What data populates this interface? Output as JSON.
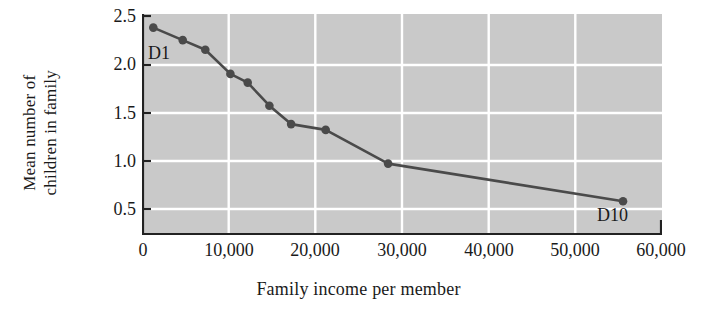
{
  "chart_data": {
    "type": "line",
    "title": "",
    "xlabel": "Family income per member",
    "ylabel": "Mean number of children in family",
    "ylabel_lines": [
      "Mean number of",
      "children in family"
    ],
    "xlim": [
      0,
      60000
    ],
    "ylim": [
      0,
      2.5
    ],
    "xticks": [
      0,
      10000,
      20000,
      30000,
      40000,
      50000,
      60000
    ],
    "xticklabels": [
      "0",
      "10,000",
      "20,000",
      "30,000",
      "40,000",
      "50,000",
      "60,000"
    ],
    "yticks": [
      0.5,
      1.0,
      1.5,
      2.0,
      2.5
    ],
    "yticklabels": [
      "0.5",
      "1.0",
      "1.5",
      "2.0",
      "2.5"
    ],
    "grid": true,
    "grid_color": "#ffffff",
    "plot_background": "#c9c9c9",
    "line_color": "#4a4a4a",
    "marker_color": "#4a4a4a",
    "legend": "none",
    "x": [
      1300,
      4700,
      7300,
      10200,
      12200,
      14700,
      17200,
      21200,
      28400,
      55500
    ],
    "values": [
      2.38,
      2.25,
      2.15,
      1.9,
      1.81,
      1.57,
      1.38,
      1.32,
      0.97,
      0.58
    ],
    "point_labels": [
      {
        "name": "D1",
        "index": 0,
        "text": "D1"
      },
      {
        "name": "D10",
        "index": 9,
        "text": "D10"
      }
    ],
    "annotations": [
      "D1",
      "D10"
    ]
  }
}
